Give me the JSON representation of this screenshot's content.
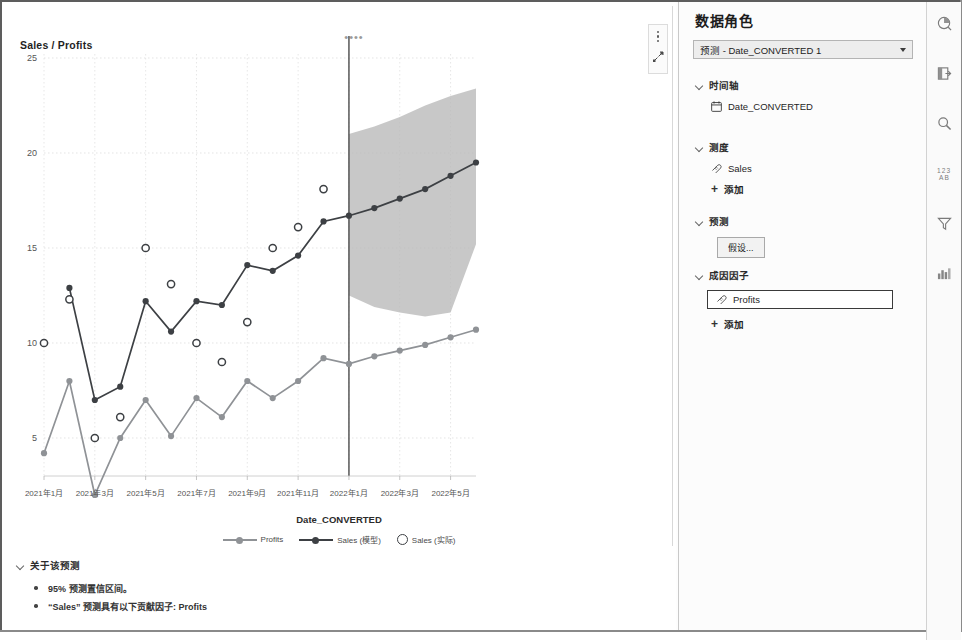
{
  "viz": {
    "drag_handle": "••••",
    "chart_title": "Sales / Profits",
    "menu_icon": "kebab-menu-icon",
    "expand_icon": "expand-icon",
    "x_axis_title": "Date_CONVERTED",
    "legend": [
      {
        "label": "Profits",
        "style": "line-marker",
        "color": "#8f9296"
      },
      {
        "label": "Sales (模型)",
        "style": "line-marker",
        "color": "#3d4044"
      },
      {
        "label": "Sales (实际)",
        "style": "open-circle",
        "color": "#3d4044"
      }
    ],
    "about": {
      "header": "关于该预测",
      "bullets": [
        "95% 预测置信区间。",
        "“Sales” 预测具有以下贡献因子: Profits"
      ]
    }
  },
  "panel": {
    "title": "数据角色",
    "selector": {
      "value": "预测 - Date_CONVERTED 1",
      "caret": "chevron-down-icon"
    },
    "groups": [
      {
        "name": "时间轴",
        "items": [
          {
            "label": "Date_CONVERTED",
            "icon": "calendar-icon",
            "boxed": false
          }
        ],
        "add": null
      },
      {
        "name": "测度",
        "items": [
          {
            "label": "Sales",
            "icon": "measure-icon",
            "boxed": false
          }
        ],
        "add": "添加"
      },
      {
        "name": "预测",
        "button": "假设...",
        "items": [],
        "add": null
      },
      {
        "name": "成因因子",
        "items": [
          {
            "label": "Profits",
            "icon": "measure-icon",
            "boxed": true
          }
        ],
        "add": "添加"
      }
    ]
  },
  "rail": {
    "icons": [
      {
        "name": "data-icon",
        "glyph": "◔"
      },
      {
        "name": "page-options-icon",
        "glyph": "⊟"
      },
      {
        "name": "search-icon",
        "glyph": "⌕"
      },
      {
        "name": "data-roles-icon",
        "glyph": "⒔"
      },
      {
        "name": "filter-icon",
        "glyph": "▽"
      },
      {
        "name": "chart-options-icon",
        "glyph": "▥"
      }
    ]
  },
  "chart_data": {
    "type": "line",
    "title": "Sales / Profits",
    "xlabel": "Date_CONVERTED",
    "ylabel": "Sales / Profits",
    "ylim": [
      0,
      25
    ],
    "yticks": [
      5,
      10,
      15,
      20,
      25
    ],
    "grid": true,
    "legend_position": "bottom",
    "x": [
      "2021年1月",
      "2021年2月",
      "2021年3月",
      "2021年4月",
      "2021年5月",
      "2021年6月",
      "2021年7月",
      "2021年8月",
      "2021年9月",
      "2021年10月",
      "2021年11月",
      "2021年12月",
      "2022年1月",
      "2022年2月",
      "2022年3月",
      "2022年4月",
      "2022年5月",
      "2022年6月"
    ],
    "xtick_labels": [
      "2021年1月",
      "2021年3月",
      "2021年5月",
      "2021年7月",
      "2021年9月",
      "2021年11月",
      "2022年1月",
      "2022年3月",
      "2022年5月"
    ],
    "forecast_start_index": 12,
    "forecast_start_label": "2022年1月",
    "confidence_level": "95%",
    "series": [
      {
        "name": "Sales (模型)",
        "type": "line",
        "color": "#3d4044",
        "marker": "filled-circle",
        "values": [
          null,
          12.9,
          7.0,
          7.7,
          12.2,
          10.6,
          12.2,
          12.0,
          14.1,
          13.8,
          14.6,
          16.4,
          16.7,
          17.1,
          17.6,
          18.1,
          18.8,
          19.5
        ]
      },
      {
        "name": "Sales (实际)",
        "type": "scatter",
        "color": "#3d4044",
        "marker": "open-circle",
        "values": [
          10.0,
          12.3,
          5.0,
          6.1,
          15.0,
          13.1,
          10.0,
          9.0,
          11.1,
          15.0,
          16.1,
          18.1,
          null,
          null,
          null,
          null,
          null,
          null
        ]
      },
      {
        "name": "Profits",
        "type": "line",
        "color": "#8f9296",
        "marker": "filled-circle",
        "values": [
          4.2,
          8.0,
          2.0,
          5.0,
          7.0,
          5.1,
          7.1,
          6.1,
          8.0,
          7.1,
          8.0,
          9.2,
          8.9,
          9.3,
          9.6,
          9.9,
          10.3,
          10.7
        ]
      }
    ],
    "confidence_band": {
      "name": "95% 预测置信区间",
      "color": "#b9b9b9",
      "upper": [
        null,
        null,
        null,
        null,
        null,
        null,
        null,
        null,
        null,
        null,
        null,
        null,
        21.0,
        21.4,
        21.9,
        22.5,
        23.0,
        23.4
      ],
      "lower": [
        null,
        null,
        null,
        null,
        null,
        null,
        null,
        null,
        null,
        null,
        null,
        null,
        12.5,
        11.9,
        11.6,
        11.4,
        11.6,
        15.2
      ]
    }
  }
}
